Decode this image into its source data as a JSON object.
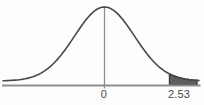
{
  "figure": {
    "colors": {
      "background": "#fdfdfd",
      "curve": "#474747",
      "axis": "#8f8f8f",
      "center_line": "#8f8f8f",
      "shade_fill": "#5e5e5e",
      "shade_stroke": "#3a3a3a",
      "label": "#474747"
    }
  },
  "chart_data": {
    "type": "area",
    "curve": "standard-normal",
    "tick_labels": [
      "0",
      "2.53"
    ],
    "x_ticks": [
      0,
      2.53
    ],
    "center_line_at": 0,
    "shaded_region": {
      "from": 2.53,
      "to": 3.6,
      "side": "right-tail"
    },
    "grid": false,
    "legend": false,
    "ylabel": "",
    "xlabel": ""
  }
}
